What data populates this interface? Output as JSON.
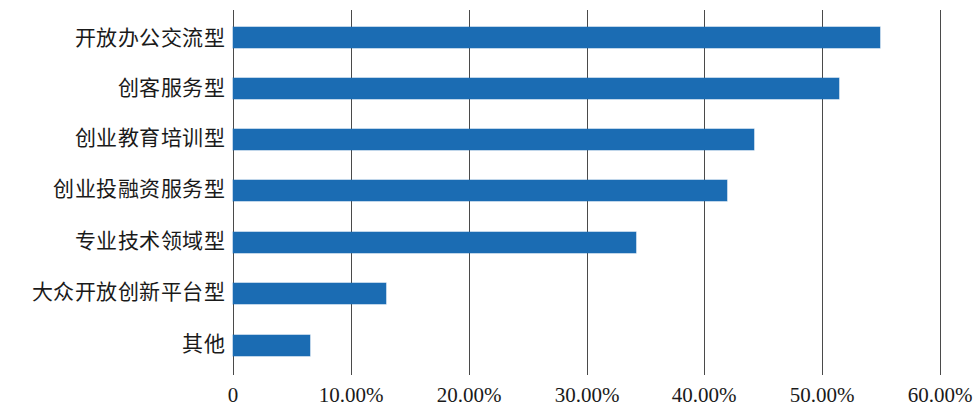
{
  "chart_data": {
    "type": "bar",
    "orientation": "horizontal",
    "title": "",
    "subtitle": "",
    "xlabel": "",
    "ylabel": "",
    "categories": [
      "开放办公交流型",
      "创客服务型",
      "创业教育培训型",
      "创业投融资服务型",
      "专业技术领域型",
      "大众开放创新平台型",
      "其他"
    ],
    "values": [
      54.9,
      51.4,
      44.2,
      41.9,
      34.2,
      13.0,
      6.5
    ],
    "value_unit": "%",
    "xlim": [
      0,
      60
    ],
    "xtick_values": [
      0,
      10,
      20,
      30,
      40,
      50,
      60
    ],
    "xtick_labels": [
      "0",
      "10.00%",
      "20.00%",
      "30.00%",
      "40.00%",
      "50.00%",
      "60.00%"
    ],
    "grid": true,
    "grid_axis": "x",
    "legend": false,
    "legend_position": "none",
    "series": [
      {
        "name": "",
        "values": [
          54.9,
          51.4,
          44.2,
          41.9,
          34.2,
          13.0,
          6.5
        ]
      }
    ],
    "colors": {
      "bar": "#1b6cb3",
      "gridline": "#4a4a4a",
      "text": "#1a1a1a",
      "background": "#ffffff"
    }
  }
}
